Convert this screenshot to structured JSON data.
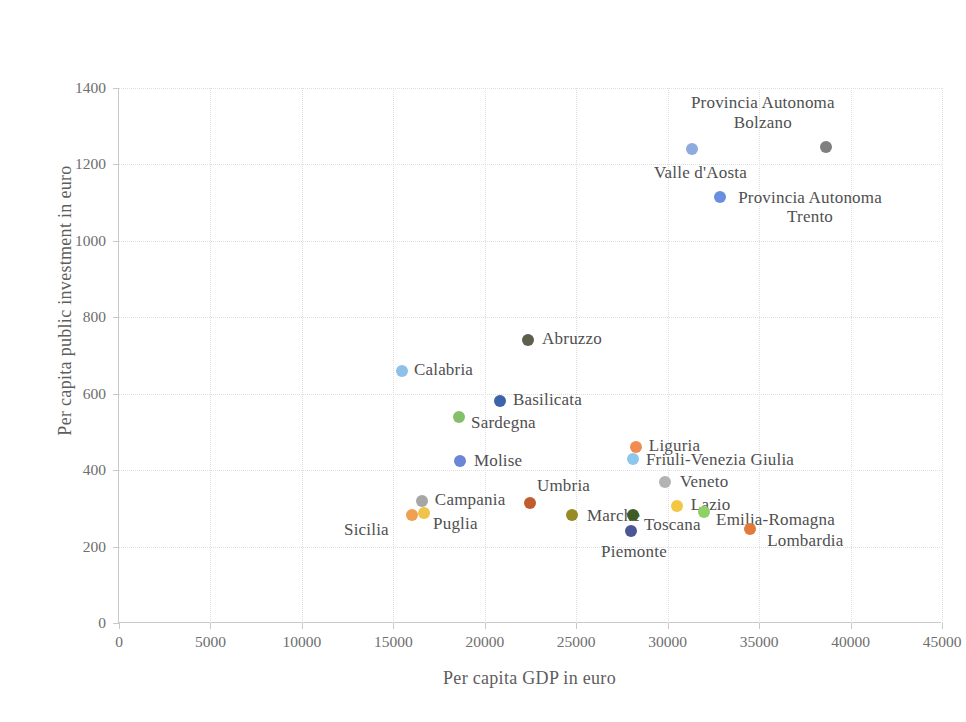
{
  "chart_data": {
    "type": "scatter",
    "title": "",
    "xlabel": "Per capita GDP in euro",
    "ylabel": "Per capita public investment in euro",
    "xlim": [
      0,
      45000
    ],
    "ylim": [
      0,
      1400
    ],
    "xticks": [
      "0",
      "5000",
      "10000",
      "15000",
      "20000",
      "25000",
      "30000",
      "35000",
      "40000",
      "45000"
    ],
    "yticks": [
      "0",
      "200",
      "400",
      "600",
      "800",
      "1000",
      "1200",
      "1400"
    ],
    "grid": true,
    "legend": "none",
    "points": [
      {
        "label": "Provincia Autonoma Bolzano",
        "label_lines": [
          "Provincia Autonoma",
          "Bolzano"
        ],
        "x": 38650,
        "y": 1245,
        "color": "#7f7f7f"
      },
      {
        "label": "Valle d'Aosta",
        "label_lines": [
          "Valle d'Aosta"
        ],
        "x": 31330,
        "y": 1240,
        "color": "#8faadc"
      },
      {
        "label": "Provincia Autonoma Trento",
        "label_lines": [
          "Provincia Autonoma",
          "Trento"
        ],
        "x": 32870,
        "y": 1115,
        "color": "#6b8ee0"
      },
      {
        "label": "Abruzzo",
        "label_lines": [
          "Abruzzo"
        ],
        "x": 22370,
        "y": 740,
        "color": "#5d5f4c"
      },
      {
        "label": "Calabria",
        "label_lines": [
          "Calabria"
        ],
        "x": 15470,
        "y": 660,
        "color": "#8ec0e8"
      },
      {
        "label": "Basilicata",
        "label_lines": [
          "Basilicata"
        ],
        "x": 20830,
        "y": 580,
        "color": "#3d63a8"
      },
      {
        "label": "Sardegna",
        "label_lines": [
          "Sardegna"
        ],
        "x": 18590,
        "y": 540,
        "color": "#86bf6a"
      },
      {
        "label": "Molise",
        "label_lines": [
          "Molise"
        ],
        "x": 18640,
        "y": 425,
        "color": "#6b86d6"
      },
      {
        "label": "Liguria",
        "label_lines": [
          "Liguria"
        ],
        "x": 28260,
        "y": 460,
        "color": "#f08b52"
      },
      {
        "label": "Friuli-Venezia Giulia",
        "label_lines": [
          "Friuli-Venezia Giulia"
        ],
        "x": 28100,
        "y": 430,
        "color": "#8ec7ec"
      },
      {
        "label": "Veneto",
        "label_lines": [
          "Veneto"
        ],
        "x": 29850,
        "y": 370,
        "color": "#b3b3b3"
      },
      {
        "label": "Lazio",
        "label_lines": [
          "Lazio"
        ],
        "x": 30500,
        "y": 305,
        "color": "#f2c842"
      },
      {
        "label": "Umbria",
        "label_lines": [
          "Umbria"
        ],
        "x": 22470,
        "y": 315,
        "color": "#bf5d2e"
      },
      {
        "label": "Campania",
        "label_lines": [
          "Campania"
        ],
        "x": 16560,
        "y": 318,
        "color": "#a6a6a6"
      },
      {
        "label": "Puglia",
        "label_lines": [
          "Puglia"
        ],
        "x": 16680,
        "y": 288,
        "color": "#f0c349"
      },
      {
        "label": "Sicilia",
        "label_lines": [
          "Sicilia"
        ],
        "x": 16020,
        "y": 283,
        "color": "#f0a050"
      },
      {
        "label": "Marche",
        "label_lines": [
          "Marche"
        ],
        "x": 24770,
        "y": 283,
        "color": "#968c23"
      },
      {
        "label": "Toscana",
        "label_lines": [
          "Toscana"
        ],
        "x": 28100,
        "y": 283,
        "color": "#3f5c25"
      },
      {
        "label": "Emilia-Romagna",
        "label_lines": [
          "Emilia-Romagna"
        ],
        "x": 31990,
        "y": 290,
        "color": "#8fd164"
      },
      {
        "label": "Lombardia",
        "label_lines": [
          "Lombardia"
        ],
        "x": 34510,
        "y": 245,
        "color": "#e07b3c"
      },
      {
        "label": "Piemonte",
        "label_lines": [
          "Piemonte"
        ],
        "x": 28000,
        "y": 240,
        "color": "#4a5698"
      }
    ]
  },
  "axis": {
    "x_title": "Per capita GDP in euro",
    "y_title": "Per capita public investment in euro"
  }
}
